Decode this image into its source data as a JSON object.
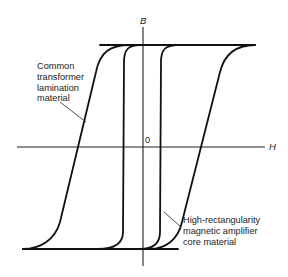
{
  "diagram": {
    "type": "B-H hysteresis loops",
    "axes": {
      "vertical_label": "B",
      "horizontal_label": "H",
      "origin_label": "0"
    },
    "annotations": {
      "wide_loop": [
        "Common",
        "transformer",
        "lamination",
        "material"
      ],
      "rect_loop": [
        "High-rectangularity",
        "magnetic amplifier",
        "core material"
      ]
    },
    "colors": {
      "ink": "#111111",
      "background": "#ffffff"
    }
  }
}
